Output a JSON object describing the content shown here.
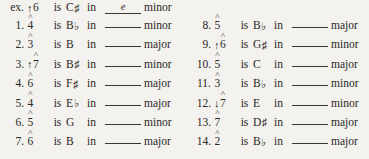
{
  "example": {
    "label": "ex.",
    "arrow": "↑",
    "degree": "6",
    "caret": "̂",
    "is": "is",
    "note": "C",
    "accidental": "♯",
    "in": "in",
    "answer": "e",
    "quality": "minor"
  },
  "labels": {
    "is": "is",
    "in": "in",
    "blank_placeholder": ""
  },
  "left_column": [
    {
      "num": "1.",
      "arrow": "",
      "degree": "4",
      "note": "B",
      "accidental": "♭",
      "quality": "minor"
    },
    {
      "num": "2.",
      "arrow": "",
      "degree": "3",
      "note": "B",
      "accidental": "",
      "quality": "major"
    },
    {
      "num": "3.",
      "arrow": "↑",
      "degree": "7",
      "note": "B",
      "accidental": "♯",
      "quality": "minor"
    },
    {
      "num": "4.",
      "arrow": "",
      "degree": "6",
      "note": "F",
      "accidental": "♯",
      "quality": "major"
    },
    {
      "num": "5.",
      "arrow": "",
      "degree": "4",
      "note": "E",
      "accidental": "♭",
      "quality": "major"
    },
    {
      "num": "6.",
      "arrow": "",
      "degree": "5",
      "note": "G",
      "accidental": "",
      "quality": "minor"
    },
    {
      "num": "7.",
      "arrow": "",
      "degree": "6",
      "note": "B",
      "accidental": "",
      "quality": "major"
    }
  ],
  "right_column": [
    {
      "num": "8.",
      "arrow": "",
      "degree": "5",
      "note": "B",
      "accidental": "♭",
      "quality": "major"
    },
    {
      "num": "9.",
      "arrow": "↑",
      "degree": "6",
      "note": "G",
      "accidental": "♯",
      "quality": "minor"
    },
    {
      "num": "10.",
      "arrow": "",
      "degree": "5",
      "note": "C",
      "accidental": "",
      "quality": "major"
    },
    {
      "num": "11.",
      "arrow": "",
      "degree": "3",
      "note": "B",
      "accidental": "♭",
      "quality": "minor"
    },
    {
      "num": "12.",
      "arrow": "↓",
      "degree": "7",
      "note": "E",
      "accidental": "",
      "quality": "minor"
    },
    {
      "num": "13.",
      "arrow": "",
      "degree": "7",
      "note": "D",
      "accidental": "♯",
      "quality": "major"
    },
    {
      "num": "14.",
      "arrow": "",
      "degree": "2",
      "note": "B",
      "accidental": "♭",
      "quality": "major"
    }
  ]
}
